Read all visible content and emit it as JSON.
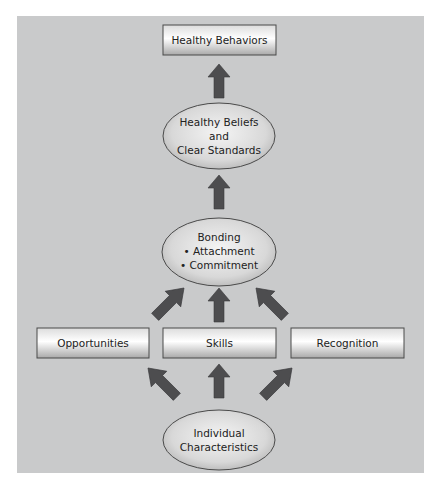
{
  "diagram": {
    "type": "flow",
    "direction": "bottom-to-top",
    "nodes": {
      "healthy_behaviors": {
        "shape": "rectangle",
        "lines": [
          "Healthy Behaviors"
        ]
      },
      "healthy_beliefs": {
        "shape": "ellipse",
        "lines": [
          "Healthy Beliefs",
          "and",
          "Clear Standards"
        ]
      },
      "bonding": {
        "shape": "ellipse",
        "lines": [
          "Bonding",
          "• Attachment",
          "• Commitment"
        ]
      },
      "opportunities": {
        "shape": "rectangle",
        "lines": [
          "Opportunities"
        ]
      },
      "skills": {
        "shape": "rectangle",
        "lines": [
          "Skills"
        ]
      },
      "recognition": {
        "shape": "rectangle",
        "lines": [
          "Recognition"
        ]
      },
      "individual_characteristics": {
        "shape": "ellipse",
        "lines": [
          "Individual",
          "Characteristics"
        ]
      }
    },
    "edges": [
      {
        "from": "healthy_beliefs",
        "to": "healthy_behaviors"
      },
      {
        "from": "bonding",
        "to": "healthy_beliefs"
      },
      {
        "from": "opportunities",
        "to": "bonding"
      },
      {
        "from": "skills",
        "to": "bonding"
      },
      {
        "from": "recognition",
        "to": "bonding"
      },
      {
        "from": "individual_characteristics",
        "to": "opportunities"
      },
      {
        "from": "individual_characteristics",
        "to": "skills"
      },
      {
        "from": "individual_characteristics",
        "to": "recognition"
      }
    ],
    "colors": {
      "background": "#c9cacb",
      "arrow": "#4d4d4f",
      "box_border": "#4a4a4a",
      "text": "#222222"
    }
  }
}
